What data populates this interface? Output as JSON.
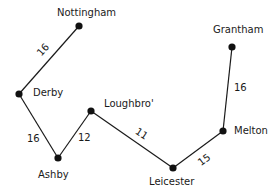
{
  "diagram": {
    "type": "weighted-network",
    "nodes": [
      {
        "id": "nottingham",
        "label": "Nottingham",
        "x": 79,
        "y": 26,
        "lx": 57,
        "ly": 8
      },
      {
        "id": "derby",
        "label": "Derby",
        "x": 19,
        "y": 94,
        "lx": 33,
        "ly": 88
      },
      {
        "id": "ashby",
        "label": "Ashby",
        "x": 58,
        "y": 158,
        "lx": 38,
        "ly": 170
      },
      {
        "id": "loughbro",
        "label": "Loughbro'",
        "x": 91,
        "y": 111,
        "lx": 104,
        "ly": 99
      },
      {
        "id": "leicester",
        "label": "Leicester",
        "x": 173,
        "y": 168,
        "lx": 149,
        "ly": 177
      },
      {
        "id": "melton",
        "label": "Melton",
        "x": 223,
        "y": 131,
        "lx": 234,
        "ly": 126
      },
      {
        "id": "grantham",
        "label": "Grantham",
        "x": 232,
        "y": 47,
        "lx": 213,
        "ly": 25
      }
    ],
    "edges": [
      {
        "from": "nottingham",
        "to": "derby",
        "weight": "16",
        "lx": 37,
        "ly": 45,
        "rot": -48
      },
      {
        "from": "derby",
        "to": "ashby",
        "weight": "16",
        "lx": 27,
        "ly": 134,
        "rot": 0
      },
      {
        "from": "ashby",
        "to": "loughbro",
        "weight": "12",
        "lx": 78,
        "ly": 133,
        "rot": 0
      },
      {
        "from": "loughbro",
        "to": "leicester",
        "weight": "11",
        "lx": 135,
        "ly": 129,
        "rot": 33
      },
      {
        "from": "leicester",
        "to": "melton",
        "weight": "15",
        "lx": 198,
        "ly": 155,
        "rot": -37
      },
      {
        "from": "melton",
        "to": "grantham",
        "weight": "16",
        "lx": 234,
        "ly": 83,
        "rot": 0
      }
    ],
    "colors": {
      "line": "#1a1a1a",
      "node": "#111111",
      "text": "#1a1a1a",
      "background": "#ffffff"
    }
  }
}
